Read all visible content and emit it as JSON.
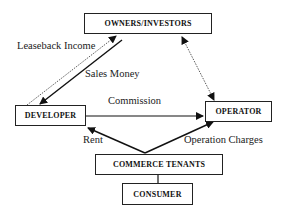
{
  "diagram": {
    "nodes": {
      "owners": "OWNERS/INVESTORS",
      "developer": "DEVELOPER",
      "operator": "OPERATOR",
      "tenants": "COMMERCE TENANTS",
      "consumer": "CONSUMER"
    },
    "edges": {
      "leaseback": "Leaseback Income",
      "sales": "Sales Money",
      "commission": "Commission",
      "rent": "Rent",
      "operation": "Operation Charges"
    },
    "relations": [
      {
        "from": "developer",
        "to": "owners",
        "label": "Leaseback Income",
        "style": "dotted"
      },
      {
        "from": "owners",
        "to": "developer",
        "label": "Sales Money",
        "style": "solid"
      },
      {
        "from": "owners",
        "to": "operator",
        "label": "",
        "style": "dotted-bidirectional"
      },
      {
        "from": "developer",
        "to": "operator",
        "label": "Commission",
        "style": "solid"
      },
      {
        "from": "tenants",
        "to": "developer",
        "label": "Rent",
        "style": "solid"
      },
      {
        "from": "tenants",
        "to": "operator",
        "label": "Operation Charges",
        "style": "solid"
      },
      {
        "from": "tenants",
        "to": "consumer",
        "label": "",
        "style": "line"
      }
    ]
  }
}
